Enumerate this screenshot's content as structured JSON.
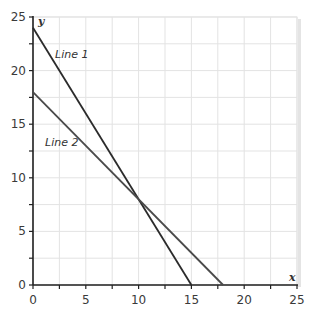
{
  "chart_data": {
    "type": "line",
    "title": "",
    "xlabel": "x",
    "ylabel": "y",
    "xlim": [
      0,
      25
    ],
    "ylim": [
      0,
      25
    ],
    "x_ticks": [
      0,
      5,
      10,
      15,
      20,
      25
    ],
    "y_ticks": [
      0,
      5,
      10,
      15,
      20,
      25
    ],
    "minor_tick_step": 2.5,
    "grid": true,
    "grid_step": 2.5,
    "series": [
      {
        "name": "Line 1",
        "points": [
          [
            0,
            24
          ],
          [
            15,
            0
          ]
        ],
        "color": "#2b2b2b",
        "label_pos": [
          4.7,
          21.2
        ]
      },
      {
        "name": "Line 2",
        "points": [
          [
            0,
            18
          ],
          [
            18,
            0
          ]
        ],
        "color": "#4a4a4a",
        "label_pos": [
          1.1,
          13.2
        ]
      }
    ],
    "intersection": [
      10,
      8
    ],
    "legend": "none (inline labels)"
  },
  "labels": {
    "x_axis": "x",
    "y_axis": "y",
    "line1": "Line 1",
    "line2": "Line 2"
  }
}
